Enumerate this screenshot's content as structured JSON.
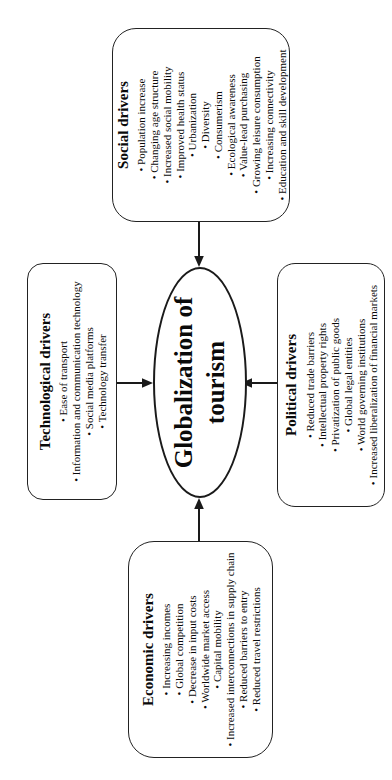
{
  "bullet": "•",
  "center": {
    "line1": "Globalization of",
    "line2": "tourism"
  },
  "boxes": {
    "social": {
      "title": "Social drivers",
      "items": [
        "Population increase",
        "Changing age structure",
        "Increased social mobility",
        "Improved health status",
        "Urbanization",
        "Diversity",
        "Consumerism",
        "Ecological awareness",
        "Value-lead purchasing",
        "Growing leisure consumption",
        "Increasing connectivity",
        "Education and skill development"
      ]
    },
    "technological": {
      "title": "Technological drivers",
      "items": [
        "Ease of transport",
        "Information and communication technology",
        "Social media platforms",
        "Technology transfer"
      ]
    },
    "political": {
      "title": "Political drivers",
      "items": [
        "Reduced trade barriers",
        "Intellectual property rights",
        "Privatization of public goods",
        "Global legal entities",
        "World governing institutions",
        "Increased liberalization of financial markets"
      ]
    },
    "economic": {
      "title": "Economic drivers",
      "items": [
        "Increasing incomes",
        "Global competition",
        "Decrease in input costs",
        "Worldwide market access",
        "Capital mobility",
        "Increased interconnections in supply chain",
        "Reduced barriers to entry",
        "Reduced travel restrictions"
      ]
    }
  },
  "connections": [
    {
      "from": "Social drivers",
      "to": "Globalization of tourism"
    },
    {
      "from": "Technological drivers",
      "to": "Globalization of tourism"
    },
    {
      "from": "Political drivers",
      "to": "Globalization of tourism"
    },
    {
      "from": "Economic drivers",
      "to": "Globalization of tourism"
    }
  ],
  "colors": {
    "line": "#1a1a1a",
    "text": "#000000",
    "background": "#ffffff"
  }
}
